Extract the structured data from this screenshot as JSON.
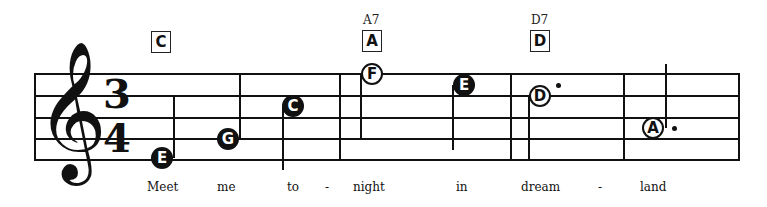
{
  "time_signature": {
    "top": "3",
    "bottom": "4"
  },
  "clef": {
    "glyph": "𝄞",
    "name": "treble-clef"
  },
  "chords": [
    {
      "box": "C",
      "name": ""
    },
    {
      "box": "A",
      "name": "A7"
    },
    {
      "box": "D",
      "name": "D7"
    }
  ],
  "notes": [
    {
      "letter": "E",
      "style": "filled"
    },
    {
      "letter": "G",
      "style": "filled"
    },
    {
      "letter": "C",
      "style": "filled"
    },
    {
      "letter": "F",
      "style": "open"
    },
    {
      "letter": "E",
      "style": "filled"
    },
    {
      "letter": "D",
      "style": "open",
      "dotted": true
    },
    {
      "letter": "A",
      "style": "open",
      "dotted": true
    }
  ],
  "lyrics": [
    "Meet",
    "me",
    "to",
    "-",
    "night",
    "in",
    "dream",
    "-",
    "land"
  ]
}
